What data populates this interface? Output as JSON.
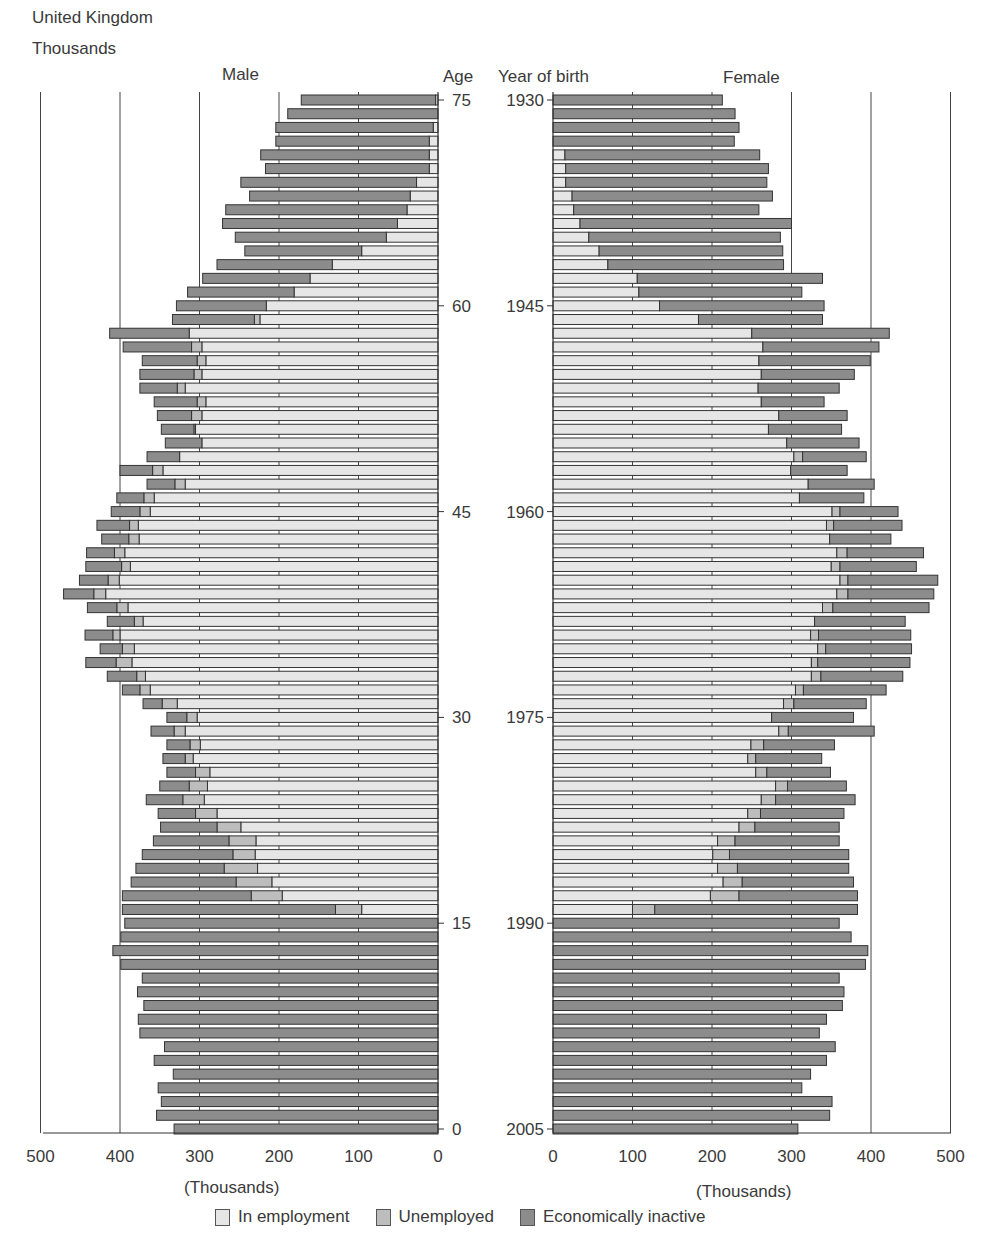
{
  "header": {
    "region": "United Kingdom",
    "units": "Thousands"
  },
  "labels": {
    "male": "Male",
    "female": "Female",
    "age": "Age",
    "year_of_birth": "Year of birth",
    "x_axis_male": "(Thousands)",
    "x_axis_female": "(Thousands)"
  },
  "legend": [
    {
      "label": "In employment",
      "color": "#e6e6e6"
    },
    {
      "label": "Unemployed",
      "color": "#bdbdbd"
    },
    {
      "label": "Economically inactive",
      "color": "#8c8c8c"
    }
  ],
  "chart_data": {
    "type": "bar",
    "orientation": "horizontal",
    "stacked": true,
    "xlabel": "(Thousands)",
    "ylabel_left": "Age",
    "ylabel_right": "Year of birth",
    "xlim": [
      0,
      500
    ],
    "male_x_ticks": [
      500,
      400,
      300,
      200,
      100,
      0
    ],
    "female_x_ticks": [
      0,
      100,
      200,
      300,
      400,
      500
    ],
    "age_ticks": [
      75,
      60,
      45,
      30,
      15,
      0
    ],
    "year_ticks": [
      1930,
      1945,
      1960,
      1975,
      1990,
      2005
    ],
    "grid": true,
    "legend_position": "bottom",
    "categories_age_desc": [
      75,
      74,
      73,
      72,
      71,
      70,
      69,
      68,
      67,
      66,
      65,
      64,
      63,
      62,
      61,
      60,
      59,
      58,
      57,
      56,
      55,
      54,
      53,
      52,
      51,
      50,
      49,
      48,
      47,
      46,
      45,
      44,
      43,
      42,
      41,
      40,
      39,
      38,
      37,
      36,
      35,
      34,
      33,
      32,
      31,
      30,
      29,
      28,
      27,
      26,
      25,
      24,
      23,
      22,
      21,
      20,
      19,
      18,
      17,
      16,
      15,
      14,
      13,
      12,
      11,
      10,
      9,
      8,
      7,
      6,
      5,
      4,
      3,
      2,
      1,
      0
    ],
    "male": {
      "in_employment": [
        3,
        0,
        6,
        11,
        11,
        11,
        27,
        35,
        39,
        51,
        65,
        96,
        133,
        161,
        181,
        216,
        224,
        313,
        297,
        292,
        297,
        318,
        292,
        297,
        305,
        297,
        325,
        346,
        318,
        357,
        362,
        377,
        376,
        394,
        387,
        401,
        418,
        390,
        371,
        400,
        382,
        385,
        368,
        362,
        328,
        303,
        318,
        299,
        308,
        287,
        290,
        294,
        278,
        248,
        229,
        230,
        227,
        209,
        196,
        96,
        0,
        0,
        0,
        0,
        0,
        0,
        0,
        0,
        0,
        0,
        0,
        0,
        0,
        0,
        0,
        0
      ],
      "unemployed": [
        0,
        0,
        0,
        0,
        0,
        0,
        0,
        0,
        0,
        0,
        0,
        0,
        0,
        0,
        0,
        0,
        7,
        0,
        13,
        11,
        10,
        10,
        11,
        13,
        2,
        0,
        0,
        13,
        13,
        13,
        13,
        11,
        13,
        13,
        11,
        14,
        15,
        14,
        11,
        9,
        15,
        20,
        11,
        13,
        19,
        13,
        14,
        13,
        10,
        18,
        23,
        27,
        27,
        30,
        34,
        28,
        42,
        45,
        39,
        33,
        0,
        0,
        0,
        0,
        0,
        0,
        0,
        0,
        0,
        0,
        0,
        0,
        0,
        0,
        0,
        0
      ],
      "economically_inactive": [
        169,
        189,
        198,
        193,
        212,
        206,
        221,
        202,
        228,
        220,
        190,
        147,
        145,
        135,
        134,
        113,
        103,
        100,
        86,
        69,
        68,
        47,
        54,
        43,
        41,
        46,
        41,
        41,
        35,
        34,
        36,
        41,
        34,
        35,
        45,
        36,
        38,
        37,
        34,
        35,
        28,
        38,
        37,
        22,
        24,
        25,
        29,
        29,
        28,
        36,
        37,
        46,
        47,
        71,
        95,
        114,
        111,
        132,
        162,
        268,
        394,
        399,
        409,
        399,
        372,
        378,
        370,
        377,
        375,
        344,
        357,
        333,
        352,
        348,
        354,
        332
      ]
    },
    "female": {
      "in_employment": [
        0,
        0,
        0,
        0,
        15,
        16,
        16,
        24,
        26,
        34,
        45,
        58,
        69,
        106,
        108,
        134,
        183,
        250,
        264,
        259,
        262,
        258,
        262,
        284,
        271,
        294,
        303,
        299,
        321,
        310,
        351,
        344,
        348,
        357,
        350,
        361,
        357,
        339,
        329,
        324,
        333,
        325,
        325,
        305,
        290,
        275,
        284,
        249,
        245,
        255,
        280,
        262,
        245,
        234,
        207,
        201,
        207,
        214,
        198,
        100,
        0,
        0,
        0,
        0,
        0,
        0,
        0,
        0,
        0,
        0,
        0,
        0,
        0,
        0,
        0,
        0
      ],
      "unemployed": [
        0,
        0,
        0,
        0,
        0,
        0,
        0,
        0,
        0,
        0,
        0,
        0,
        0,
        0,
        0,
        0,
        0,
        0,
        0,
        0,
        0,
        0,
        0,
        0,
        0,
        0,
        11,
        0,
        0,
        0,
        10,
        9,
        0,
        13,
        11,
        10,
        14,
        13,
        0,
        10,
        10,
        8,
        12,
        10,
        13,
        0,
        12,
        16,
        10,
        14,
        15,
        18,
        16,
        20,
        22,
        21,
        25,
        24,
        36,
        28,
        0,
        0,
        0,
        0,
        0,
        0,
        0,
        0,
        0,
        0,
        0,
        0,
        0,
        0,
        0,
        0
      ],
      "economically_inactive": [
        213,
        229,
        234,
        228,
        245,
        255,
        253,
        252,
        233,
        266,
        241,
        231,
        221,
        233,
        205,
        207,
        156,
        173,
        146,
        140,
        117,
        102,
        79,
        86,
        92,
        91,
        80,
        71,
        83,
        81,
        73,
        86,
        77,
        96,
        96,
        113,
        108,
        121,
        114,
        116,
        108,
        116,
        103,
        104,
        91,
        103,
        108,
        89,
        83,
        80,
        74,
        100,
        105,
        106,
        131,
        150,
        140,
        140,
        149,
        255,
        360,
        375,
        396,
        393,
        360,
        366,
        364,
        344,
        335,
        355,
        344,
        324,
        313,
        351,
        348,
        308
      ]
    }
  }
}
